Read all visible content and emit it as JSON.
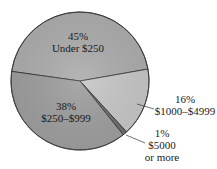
{
  "chart_data": {
    "type": "pie",
    "title": "",
    "categories": [
      "Under $250",
      "$250–$999",
      "$1000–$4999",
      "$5000 or more"
    ],
    "values": [
      45,
      38,
      16,
      1
    ],
    "unit": "%",
    "legend": "none (direct labels)",
    "slices": [
      {
        "label": "Under $250",
        "value": 45,
        "pct_text": "45%",
        "color": "#acacac",
        "label_position": "inside"
      },
      {
        "label": "$250–$999",
        "value": 38,
        "pct_text": "38%",
        "color": "#9d9d9d",
        "label_position": "inside"
      },
      {
        "label": "$1000–$4999",
        "value": 16,
        "pct_text": "16%",
        "color": "#c6c6c6",
        "label_position": "outside with leader line"
      },
      {
        "label": "$5000 or more",
        "value": 1,
        "pct_text": "1%",
        "color": "#6e6e6e",
        "label_position": "outside with leader line"
      }
    ]
  },
  "labels": {
    "under250_pct": "45%",
    "under250_name": "Under $250",
    "r250_999_pct": "38%",
    "r250_999_name": "$250–$999",
    "r1000_4999_pct": "16%",
    "r1000_4999_name": "$1000–$4999",
    "r5000_pct": "1%",
    "r5000_name_line1": "$5000",
    "r5000_name_line2": "or more"
  }
}
